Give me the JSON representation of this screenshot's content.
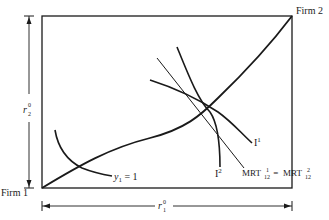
{
  "diagram": {
    "type": "edgeworth-box-production",
    "labels": {
      "firm1": "Firm 1",
      "firm2": "Firm 2",
      "isoquant_y1": "y",
      "isoquant_y1_sub": "1",
      "isoquant_y1_eq": " = 1",
      "isoquant_1": "I",
      "isoquant_1_sup": "1",
      "isoquant_2": "I",
      "isoquant_2_sup": "2",
      "mrt_left": "MRT",
      "mrt_left_sup": "1",
      "mrt_left_sub": "12",
      "mrt_eq": " = ",
      "mrt_right": "MRT",
      "mrt_right_sup": "2",
      "mrt_right_sub": "12",
      "dim_horizontal": "r",
      "dim_horizontal_sup": "0",
      "dim_horizontal_sub": "1",
      "dim_vertical": "r",
      "dim_vertical_sup": "0",
      "dim_vertical_sub": "2"
    },
    "colors": {
      "ink": "#1a1a1a",
      "background": "#ffffff"
    }
  }
}
